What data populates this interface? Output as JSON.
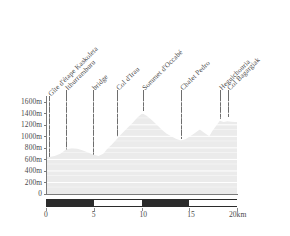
{
  "chart_data": {
    "type": "area",
    "title": "",
    "subtitle": "",
    "xlabel": "",
    "ylabel": "",
    "xlim": [
      0,
      20
    ],
    "ylim": [
      0,
      1700
    ],
    "grid": true,
    "legend_position": "none",
    "x_unit": "km",
    "y_unit": "m",
    "x_tick_labels": [
      "0",
      "5",
      "10",
      "15",
      "20km"
    ],
    "x_tick_values": [
      0,
      5,
      10,
      15,
      20
    ],
    "y_tick_labels": [
      "0",
      "200m",
      "400m",
      "600m",
      "800m",
      "1000m",
      "1200m",
      "1400m",
      "1600m"
    ],
    "y_tick_values": [
      0,
      200,
      400,
      600,
      800,
      1000,
      1200,
      1400,
      1600
    ],
    "series": [
      {
        "name": "elevation profile",
        "x": [
          0.0,
          0.35,
          0.9,
          1.5,
          2.1,
          2.7,
          3.2,
          3.8,
          4.4,
          5.0,
          5.5,
          6.0,
          6.4,
          6.9,
          7.4,
          7.9,
          8.5,
          9.1,
          9.6,
          10.1,
          10.6,
          11.1,
          11.6,
          12.1,
          12.6,
          13.1,
          13.6,
          14.1,
          14.6,
          15.1,
          15.6,
          16.1,
          16.6,
          17.1,
          17.4,
          17.8,
          18.2,
          18.6,
          19.0,
          19.4,
          19.8,
          20.0
        ],
        "y": [
          650,
          640,
          660,
          700,
          770,
          800,
          790,
          760,
          720,
          680,
          660,
          700,
          780,
          860,
          950,
          1040,
          1140,
          1240,
          1330,
          1400,
          1350,
          1280,
          1200,
          1120,
          1050,
          1000,
          960,
          930,
          950,
          1000,
          1060,
          1120,
          1060,
          1000,
          1090,
          1180,
          1270,
          1250,
          1260,
          1255,
          1250,
          1250
        ]
      }
    ],
    "annotations": [
      {
        "label": "Gîte d'étape Kaskoleta",
        "x_km": 0.35,
        "leader_top_y": 96,
        "leader_bottom_y": 160
      },
      {
        "label": "Ithurramburu",
        "x_km": 2.05,
        "leader_top_y": 90,
        "leader_bottom_y": 153
      },
      {
        "label": "bridge",
        "x_km": 4.95,
        "leader_top_y": 90,
        "leader_bottom_y": 165
      },
      {
        "label": "Col d'Irau",
        "x_km": 7.45,
        "leader_top_y": 90,
        "leader_bottom_y": 137
      },
      {
        "label": "Sommet d'Occabé",
        "x_km": 10.2,
        "leader_top_y": 90,
        "leader_bottom_y": 111
      },
      {
        "label": "Chalet Pedro",
        "x_km": 14.15,
        "leader_top_y": 90,
        "leader_bottom_y": 139
      },
      {
        "label": "Heguichouria",
        "x_km": 18.2,
        "leader_top_y": 90,
        "leader_bottom_y": 119
      },
      {
        "label": "Col Bagargiak",
        "x_km": 19.05,
        "leader_top_y": 90,
        "leader_bottom_y": 117
      }
    ],
    "scale_bar": {
      "segments": [
        {
          "from": 0,
          "to": 5,
          "fill": "dark"
        },
        {
          "from": 5,
          "to": 10,
          "fill": "light"
        },
        {
          "from": 10,
          "to": 15,
          "fill": "dark"
        },
        {
          "from": 15,
          "to": 20,
          "fill": "light"
        }
      ]
    },
    "colors": {
      "profile_fill": "#ebebeb",
      "gridline": "#ffffff",
      "axis": "#7a7a7a",
      "leader": "#6e6e6e",
      "text": "#4a4a4a",
      "scalebar_dark": "#2b2b2b",
      "background": "#ffffff"
    }
  }
}
